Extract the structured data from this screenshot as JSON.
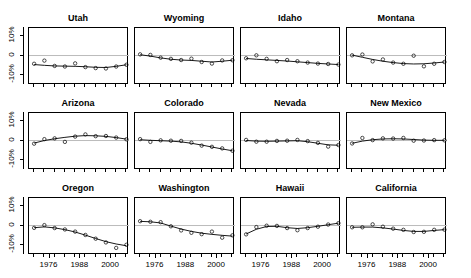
{
  "figure": {
    "layout": {
      "rows": 3,
      "cols": 4,
      "panel_count": 12
    },
    "y_axis": {
      "ticks": [
        "10%",
        "0",
        "-10%"
      ],
      "tick_values": [
        10,
        0,
        -10
      ],
      "limits": [
        -15,
        14
      ]
    },
    "x_axis": {
      "ticks": [
        "1976",
        "1988",
        "2000"
      ],
      "tick_values": [
        1976,
        1988,
        2000
      ],
      "limits": [
        1968,
        2007
      ]
    }
  },
  "chart_data": {
    "type": "line",
    "title": "",
    "subtitle": "",
    "xlabel": "",
    "ylabel": "",
    "xlim": [
      1968,
      2007
    ],
    "ylim": [
      -15,
      14
    ],
    "grid": false,
    "legend": "none",
    "zero_reference_line": 0,
    "x": [
      1970,
      1974,
      1978,
      1982,
      1986,
      1990,
      1994,
      1998,
      2002,
      2006
    ],
    "xtick_labels": [
      "1976",
      "1988",
      "2000"
    ],
    "ytick_labels": [
      "10%",
      "0",
      "-10%"
    ],
    "marker": "open-circle",
    "panels": [
      {
        "title": "Utah",
        "row": 0,
        "col": 0,
        "points": [
          -4.2,
          -2.6,
          -5.3,
          -5.6,
          -4.0,
          -5.9,
          -6.4,
          -6.6,
          -5.6,
          -4.7
        ],
        "fit": [
          -4.6,
          -5.0,
          -5.3,
          -5.4,
          -5.5,
          -5.7,
          -6.0,
          -6.1,
          -5.5,
          -4.7
        ]
      },
      {
        "title": "Wyoming",
        "row": 0,
        "col": 1,
        "points": [
          0.6,
          0.3,
          -1.1,
          -1.7,
          -2.3,
          -1.6,
          -3.3,
          -4.1,
          -2.5,
          -2.4
        ],
        "fit": [
          0.4,
          -0.3,
          -1.2,
          -1.9,
          -2.3,
          -2.5,
          -2.9,
          -3.3,
          -2.9,
          -2.4
        ]
      },
      {
        "title": "Idaho",
        "row": 0,
        "col": 2,
        "points": [
          -1.4,
          0.1,
          -1.7,
          -2.9,
          -2.3,
          -2.9,
          -3.6,
          -4.1,
          -4.3,
          -4.6
        ],
        "fit": [
          -1.5,
          -1.9,
          -2.2,
          -2.5,
          -2.8,
          -3.2,
          -3.6,
          -4.0,
          -4.3,
          -4.6
        ]
      },
      {
        "title": "Montana",
        "row": 0,
        "col": 3,
        "points": [
          0.1,
          0.5,
          -3.0,
          -2.0,
          -3.6,
          -4.2,
          -0.1,
          -5.5,
          -4.2,
          -3.3
        ],
        "fit": [
          0.2,
          -0.9,
          -2.0,
          -2.9,
          -3.6,
          -4.1,
          -4.3,
          -4.2,
          -3.8,
          -3.3
        ]
      },
      {
        "title": "Arizona",
        "row": 1,
        "col": 0,
        "points": [
          -1.6,
          0.7,
          1.1,
          -0.7,
          2.0,
          3.1,
          2.2,
          2.3,
          1.5,
          0.6
        ],
        "fit": [
          -1.3,
          0.0,
          0.9,
          1.6,
          2.2,
          2.5,
          2.4,
          2.1,
          1.5,
          0.7
        ]
      },
      {
        "title": "Colorado",
        "row": 1,
        "col": 1,
        "points": [
          0.7,
          -0.7,
          0.1,
          -0.1,
          -0.2,
          -1.1,
          -2.6,
          -3.2,
          -4.0,
          -5.2
        ],
        "fit": [
          0.4,
          0.1,
          -0.1,
          -0.3,
          -0.7,
          -1.4,
          -2.3,
          -3.3,
          -4.3,
          -5.2
        ]
      },
      {
        "title": "Nevada",
        "row": 1,
        "col": 2,
        "points": [
          0.3,
          -0.6,
          -0.6,
          -0.2,
          -0.1,
          0.3,
          -0.3,
          -1.2,
          -3.1,
          -2.3
        ],
        "fit": [
          0.0,
          -0.3,
          -0.4,
          -0.3,
          -0.2,
          -0.1,
          -0.6,
          -1.4,
          -2.2,
          -2.4
        ]
      },
      {
        "title": "New Mexico",
        "row": 1,
        "col": 3,
        "points": [
          -1.5,
          1.3,
          0.2,
          1.1,
          1.0,
          1.3,
          -0.1,
          0.0,
          0.2,
          0.1
        ],
        "fit": [
          -1.4,
          -0.3,
          0.4,
          0.8,
          0.9,
          0.8,
          0.5,
          0.2,
          0.1,
          0.1
        ]
      },
      {
        "title": "Oregon",
        "row": 2,
        "col": 0,
        "points": [
          -1.2,
          0.2,
          -1.3,
          -2.0,
          -3.1,
          -4.8,
          -6.7,
          -8.6,
          -11.4,
          -9.8
        ],
        "fit": [
          -1.1,
          -0.7,
          -1.2,
          -2.1,
          -3.3,
          -4.9,
          -6.6,
          -8.2,
          -9.4,
          -10.3
        ]
      },
      {
        "title": "Washington",
        "row": 2,
        "col": 1,
        "points": [
          2.2,
          1.9,
          1.7,
          -0.4,
          -2.5,
          -3.7,
          -4.4,
          -3.1,
          -6.2,
          -5.0
        ],
        "fit": [
          2.1,
          1.9,
          1.3,
          -0.3,
          -1.8,
          -3.0,
          -3.9,
          -4.5,
          -5.0,
          -5.4
        ]
      },
      {
        "title": "Hawaii",
        "row": 2,
        "col": 2,
        "points": [
          -4.5,
          -0.8,
          -0.1,
          -0.2,
          -1.3,
          -2.4,
          -1.3,
          -0.6,
          0.5,
          1.2
        ],
        "fit": [
          -4.3,
          -1.9,
          -0.5,
          -0.4,
          -1.1,
          -1.5,
          -1.1,
          -0.4,
          0.4,
          1.2
        ]
      },
      {
        "title": "California",
        "row": 2,
        "col": 3,
        "points": [
          -0.9,
          -0.9,
          0.6,
          -0.6,
          -1.6,
          -2.2,
          -3.3,
          -3.2,
          -2.2,
          -2.1
        ],
        "fit": [
          -0.9,
          -0.8,
          -0.8,
          -1.2,
          -1.8,
          -2.5,
          -3.0,
          -3.0,
          -2.5,
          -2.1
        ]
      }
    ]
  }
}
